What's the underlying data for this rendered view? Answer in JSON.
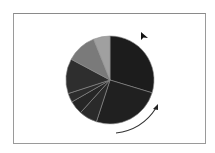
{
  "figure": {
    "frame_color": "#9a9a9a",
    "background": "#ffffff"
  },
  "chart_data": {
    "type": "pie",
    "title": "",
    "direction": "clockwise",
    "start_angle_deg": 0,
    "slices": [
      {
        "label": "",
        "value": 29.7,
        "color": "#1c1c1c"
      },
      {
        "label": "",
        "value": 25.3,
        "color": "#202020"
      },
      {
        "label": "",
        "value": 6.7,
        "color": "#2a2a2a"
      },
      {
        "label": "",
        "value": 5.0,
        "color": "#262626"
      },
      {
        "label": "",
        "value": 3.3,
        "color": "#2c2c2c"
      },
      {
        "label": "",
        "value": 12.8,
        "color": "#2e2e2e"
      },
      {
        "label": "",
        "value": 11.1,
        "color": "#7a7a7a"
      },
      {
        "label": "",
        "value": 6.1,
        "color": "#a0a0a0"
      }
    ],
    "separator_color": "#8c8c8c",
    "legend": "none"
  },
  "annotations": {
    "rotation_arrow": "clockwise-arrow",
    "cursor": "pointer-cursor"
  }
}
